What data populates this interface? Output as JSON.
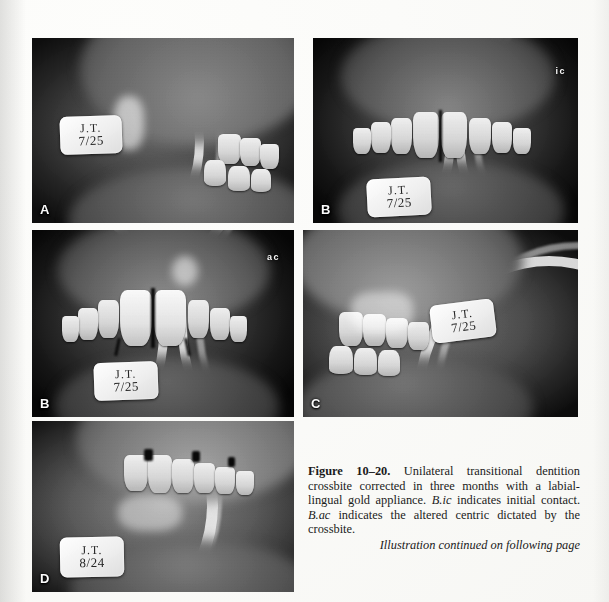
{
  "figure": {
    "number_label": "Figure 10–20.",
    "caption_body": " Unilateral transitional dentition crossbite corrected in three months with a labial-lingual gold appliance. ",
    "caption_italic_1": "B.ic",
    "caption_mid_1": " indicates initial contact. ",
    "caption_italic_2": "B.ac",
    "caption_mid_2": " indicates the altered centric dictated by the crossbite.",
    "continuation": "Illustration continued on following page"
  },
  "panels": [
    {
      "id": "a",
      "letter": "A",
      "tag_name": "J.T.",
      "tag_date": "7/25",
      "annotation": ""
    },
    {
      "id": "b-ic",
      "letter": "B",
      "tag_name": "J.T.",
      "tag_date": "7/25",
      "annotation": "ic"
    },
    {
      "id": "b-ac",
      "letter": "B",
      "tag_name": "J.T.",
      "tag_date": "7/25",
      "annotation": "ac"
    },
    {
      "id": "c",
      "letter": "C",
      "tag_name": "J.T.",
      "tag_date": "7/25",
      "annotation": ""
    },
    {
      "id": "d",
      "letter": "D",
      "tag_name": "J.T.",
      "tag_date": "8/24",
      "annotation": ""
    }
  ],
  "colors": {
    "paper": "#faf9f6",
    "ink": "#1b1b1b",
    "tag_face": "#f1f0e9"
  }
}
